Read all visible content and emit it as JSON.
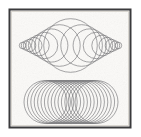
{
  "figure": {
    "canvas": {
      "width": 141,
      "height": 137,
      "background": "#ffffff"
    },
    "frame": {
      "name": "figure-border",
      "x": 9.5,
      "y": 9.5,
      "width": 121,
      "height": 118,
      "stroke": "#3a3a3c",
      "stroke_width": 2.0,
      "fill": "#fbfaf8",
      "inner_highlight": "#d9d6d0"
    },
    "paper_texture": {
      "speckle_color": "#cdc9c2",
      "opacity": 0.35
    },
    "stroke_color": "#6f6f72",
    "stroke_width": 0.62,
    "upper_figure": {
      "name": "lens-circle-family",
      "description": "Circles of varying radius centred on a common horizontal axis; radius largest at the centre and decreasing toward both ends, producing a lens (eye) shaped envelope.",
      "center_y": 45.5,
      "center_x": 70.5,
      "axis_half_span": 48.5,
      "envelope_shape": "lens",
      "max_radius": 27.0,
      "min_radius": 3.2,
      "count": 17,
      "circles": [
        {
          "cx": 22.6,
          "cy": 45.5,
          "r": 3.3
        },
        {
          "cx": 25.9,
          "cy": 45.5,
          "r": 4.6
        },
        {
          "cx": 29.6,
          "cy": 45.5,
          "r": 6.2
        },
        {
          "cx": 33.9,
          "cy": 45.5,
          "r": 8.1
        },
        {
          "cx": 38.8,
          "cy": 45.5,
          "r": 10.4
        },
        {
          "cx": 44.6,
          "cy": 45.5,
          "r": 13.2
        },
        {
          "cx": 51.3,
          "cy": 45.5,
          "r": 16.6
        },
        {
          "cx": 59.4,
          "cy": 45.5,
          "r": 20.8
        },
        {
          "cx": 70.5,
          "cy": 45.5,
          "r": 26.8
        },
        {
          "cx": 81.6,
          "cy": 45.5,
          "r": 20.8
        },
        {
          "cx": 89.7,
          "cy": 45.5,
          "r": 16.6
        },
        {
          "cx": 96.4,
          "cy": 45.5,
          "r": 13.2
        },
        {
          "cx": 102.2,
          "cy": 45.5,
          "r": 10.4
        },
        {
          "cx": 107.1,
          "cy": 45.5,
          "r": 8.1
        },
        {
          "cx": 111.4,
          "cy": 45.5,
          "r": 6.2
        },
        {
          "cx": 115.1,
          "cy": 45.5,
          "r": 4.6
        },
        {
          "cx": 118.4,
          "cy": 45.5,
          "r": 3.3
        }
      ]
    },
    "lower_figure": {
      "name": "stadium-circle-family",
      "description": "Equal radius circles evenly spaced along a horizontal axis, overlapping to produce a stadium (capsule) shaped envelope.",
      "center_y": 102.0,
      "radius": 21.5,
      "count": 16,
      "x_start": 45.5,
      "x_end": 96.5,
      "spacing": 3.4,
      "envelope_shape": "stadium",
      "circles": [
        {
          "cx": 45.5,
          "cy": 102.0,
          "r": 21.5
        },
        {
          "cx": 48.9,
          "cy": 102.0,
          "r": 21.5
        },
        {
          "cx": 52.3,
          "cy": 102.0,
          "r": 21.5
        },
        {
          "cx": 55.7,
          "cy": 102.0,
          "r": 21.5
        },
        {
          "cx": 59.1,
          "cy": 102.0,
          "r": 21.5
        },
        {
          "cx": 62.5,
          "cy": 102.0,
          "r": 21.5
        },
        {
          "cx": 65.9,
          "cy": 102.0,
          "r": 21.5
        },
        {
          "cx": 69.3,
          "cy": 102.0,
          "r": 21.5
        },
        {
          "cx": 72.7,
          "cy": 102.0,
          "r": 21.5
        },
        {
          "cx": 76.1,
          "cy": 102.0,
          "r": 21.5
        },
        {
          "cx": 79.5,
          "cy": 102.0,
          "r": 21.5
        },
        {
          "cx": 82.9,
          "cy": 102.0,
          "r": 21.5
        },
        {
          "cx": 86.3,
          "cy": 102.0,
          "r": 21.5
        },
        {
          "cx": 89.7,
          "cy": 102.0,
          "r": 21.5
        },
        {
          "cx": 93.1,
          "cy": 102.0,
          "r": 21.5
        },
        {
          "cx": 96.5,
          "cy": 102.0,
          "r": 21.5
        }
      ]
    }
  }
}
